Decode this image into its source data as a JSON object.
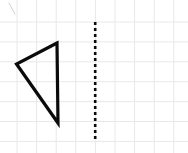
{
  "figure": {
    "type": "geometry-diagram",
    "width": 188,
    "height": 153,
    "background_color": "#ffffff"
  },
  "grid": {
    "name": "graph-paper-grid",
    "color": "#e8e8ec",
    "line_width": 1,
    "spacing_x": 19.6,
    "spacing_y": 19.9,
    "vertical_line_x": [
      17,
      36.6,
      56.2,
      75.8,
      95.4,
      115,
      134.6,
      154.2,
      173.8
    ],
    "horizontal_line_y": [
      22,
      41.9,
      61.8,
      81.7,
      101.6,
      121.5,
      141.4
    ]
  },
  "shapes": {
    "triangle": {
      "name": "triangle",
      "stroke_color": "#0b0b0b",
      "stroke_width": 3.2,
      "fill": "none",
      "closed": true,
      "vertices": [
        {
          "label": "top",
          "x": 57,
          "y": 43
        },
        {
          "label": "left",
          "x": 16.5,
          "y": 64
        },
        {
          "label": "bottom",
          "x": 58,
          "y": 123
        }
      ],
      "points_attr": "57,43 16.5,64 58,123"
    },
    "mirror_line": {
      "name": "dashed-line-of-reflection",
      "orientation": "vertical",
      "stroke_color": "#0b0b0b",
      "stroke_width": 2.6,
      "dash_pattern": "3 3",
      "x": 95.2,
      "y_start": 22,
      "y_end": 140
    },
    "stray_mark": {
      "name": "stray-pencil-mark",
      "stroke_color": "#cfcfd6",
      "stroke_width": 1,
      "x1": 9,
      "y1": 3,
      "x2": 15,
      "y2": 14
    }
  }
}
